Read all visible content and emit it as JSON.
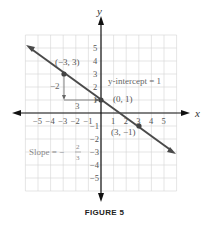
{
  "chart_data": {
    "type": "line",
    "title": "FIGURE 5",
    "xlabel": "x",
    "ylabel": "y",
    "xlim": [
      -6,
      6
    ],
    "ylim": [
      -6,
      6
    ],
    "grid": true,
    "x_ticks": [
      "-5",
      "-4",
      "-3",
      "-2",
      "-1",
      "1",
      "2",
      "3",
      "4",
      "5"
    ],
    "y_ticks": [
      "5",
      "4",
      "3",
      "2",
      "1",
      "-1",
      "-2",
      "-3",
      "-4",
      "-5"
    ],
    "line": {
      "slope": -0.6667,
      "intercept": 1,
      "x_range": [
        -5.8,
        5.8
      ]
    },
    "points": [
      {
        "x": -3,
        "y": 3,
        "label": "(−3, 3)"
      },
      {
        "x": 0,
        "y": 1,
        "label": "(0, 1)"
      },
      {
        "x": 3,
        "y": -1,
        "label": "(3, −1)"
      }
    ],
    "annotations": [
      {
        "text": "y-intercept = 1"
      },
      {
        "text": "−2",
        "meaning": "rise"
      },
      {
        "text": "3",
        "meaning": "run"
      },
      {
        "text": "Slope = − 2/3"
      }
    ]
  },
  "labels": {
    "x_axis": "x",
    "y_axis": "y",
    "p1": "(−3, 3)",
    "p2": "(0, 1)",
    "p3": "(3, −1)",
    "yint": "y-intercept = 1",
    "rise": "−2",
    "run": "3",
    "slope_prefix": "Slope = −",
    "slope_num": "2",
    "slope_den": "3",
    "caption": "FIGURE 5"
  },
  "colors": {
    "line": "#4a4a4a",
    "grid": "#d4d4d4",
    "axis": "#111111",
    "text": "#666666"
  }
}
